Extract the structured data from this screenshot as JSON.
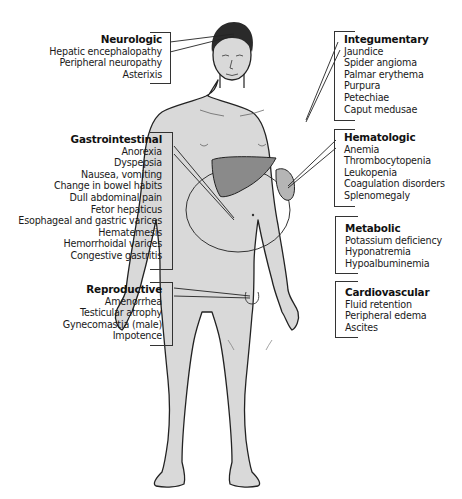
{
  "figure": {
    "colors": {
      "skin": "#d8d8d8",
      "outline": "#222222",
      "liver": "#8a8a8a",
      "spleen": "#b5b5b5",
      "hair": "#2a2a2a",
      "text": "#1a1a1a"
    }
  },
  "groups": {
    "neurologic": {
      "title": "Neurologic",
      "items": [
        "Hepatic encephalopathy",
        "Peripheral neuropathy",
        "Asterixis"
      ]
    },
    "gastrointestinal": {
      "title": "Gastrointestinal",
      "items": [
        "Anorexia",
        "Dyspepsia",
        "Nausea, vomiting",
        "Change in bowel habits",
        "Dull abdominal pain",
        "Fetor hepaticus",
        "Esophageal and gastric varices",
        "Hematemesis",
        "Hemorrhoidal varices",
        "Congestive gastritis"
      ]
    },
    "reproductive": {
      "title": "Reproductive",
      "items": [
        "Amenorrhea",
        "Testicular atrophy",
        "Gynecomastia (male)",
        "Impotence"
      ]
    },
    "integumentary": {
      "title": "Integumentary",
      "items": [
        "Jaundice",
        "Spider angioma",
        "Palmar erythema",
        "Purpura",
        "Petechiae",
        "Caput medusae"
      ]
    },
    "hematologic": {
      "title": "Hematologic",
      "items": [
        "Anemia",
        "Thrombocytopenia",
        "Leukopenia",
        "Coagulation disorders",
        "Splenomegaly"
      ]
    },
    "metabolic": {
      "title": "Metabolic",
      "items": [
        "Potassium deficiency",
        "Hyponatremia",
        "Hypoalbuminemia"
      ]
    },
    "cardiovascular": {
      "title": "Cardiovascular",
      "items": [
        "Fluid retention",
        "Peripheral edema",
        "Ascites"
      ]
    }
  }
}
